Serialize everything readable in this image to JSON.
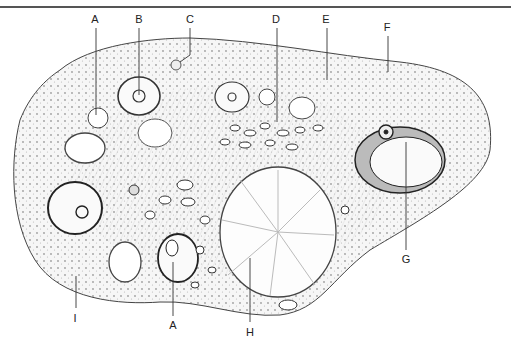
{
  "figure": {
    "labels": [
      {
        "id": "A_top",
        "text": "A",
        "x": 95,
        "y": 14,
        "lx": 96,
        "ly1": 28,
        "ly2": 115
      },
      {
        "id": "B",
        "text": "B",
        "x": 139,
        "y": 14,
        "lx": 139,
        "ly1": 28,
        "ly2": 95
      },
      {
        "id": "C",
        "text": "C",
        "x": 190,
        "y": 14,
        "lx": 190,
        "ly1": 28,
        "ly2": 58
      },
      {
        "id": "D",
        "text": "D",
        "x": 276,
        "y": 14,
        "lx": 277,
        "ly1": 28,
        "ly2": 122
      },
      {
        "id": "E",
        "text": "E",
        "x": 326,
        "y": 14,
        "lx": 327,
        "ly1": 28,
        "ly2": 80
      },
      {
        "id": "F",
        "text": "F",
        "x": 387,
        "y": 22,
        "lx": 388,
        "ly1": 36,
        "ly2": 72
      },
      {
        "id": "G",
        "text": "G",
        "x": 406,
        "y": 256,
        "lx": 406,
        "ly1": 142,
        "ly2": 250
      },
      {
        "id": "H",
        "text": "H",
        "x": 250,
        "y": 330,
        "lx": 250,
        "ly1": 258,
        "ly2": 322
      },
      {
        "id": "I",
        "text": "I",
        "x": 75,
        "y": 316,
        "lx": 76,
        "ly1": 276,
        "ly2": 308
      },
      {
        "id": "A_bottom",
        "text": "A",
        "x": 173,
        "y": 324,
        "lx": 173,
        "ly1": 262,
        "ly2": 316
      }
    ]
  }
}
